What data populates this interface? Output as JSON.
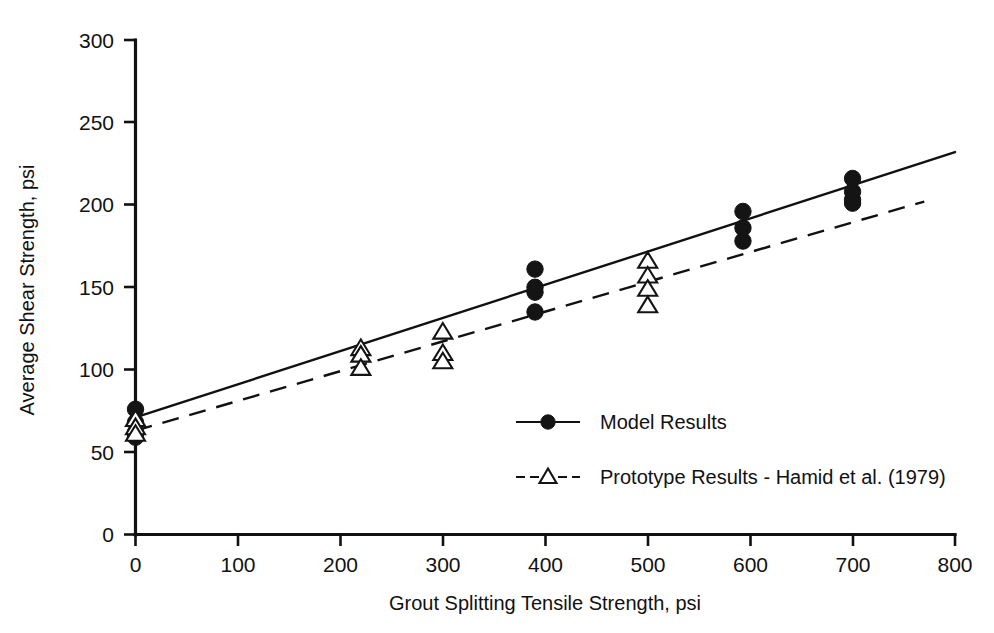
{
  "chart_data": {
    "type": "scatter",
    "title": "",
    "xlabel": "Grout Splitting Tensile Strength, psi",
    "ylabel": "Average Shear Strength, psi",
    "xlim": [
      0,
      800
    ],
    "ylim": [
      0,
      300
    ],
    "xticks": [
      0,
      100,
      200,
      300,
      400,
      500,
      600,
      700,
      800
    ],
    "yticks": [
      0,
      50,
      100,
      150,
      200,
      250,
      300
    ],
    "xtick_labels": [
      "0",
      "100",
      "200",
      "300",
      "400",
      "500",
      "600",
      "700",
      "800"
    ],
    "ytick_labels": [
      "0",
      "50",
      "100",
      "150",
      "200",
      "250",
      "300"
    ],
    "grid": false,
    "legend_position": "center-right-inside",
    "series": [
      {
        "name": "Model Results",
        "marker": "filled-circle",
        "line_style": "solid",
        "points": [
          {
            "x": 0,
            "y": 76
          },
          {
            "x": 0,
            "y": 68
          },
          {
            "x": 0,
            "y": 62
          },
          {
            "x": 0,
            "y": 59
          },
          {
            "x": 390,
            "y": 161
          },
          {
            "x": 390,
            "y": 150
          },
          {
            "x": 390,
            "y": 147
          },
          {
            "x": 390,
            "y": 135
          },
          {
            "x": 593,
            "y": 196
          },
          {
            "x": 593,
            "y": 186
          },
          {
            "x": 593,
            "y": 178
          },
          {
            "x": 700,
            "y": 216
          },
          {
            "x": 700,
            "y": 208
          },
          {
            "x": 700,
            "y": 203
          },
          {
            "x": 700,
            "y": 201
          }
        ],
        "fit_line": {
          "x1": 0,
          "y1": 71,
          "x2": 800,
          "y2": 232
        }
      },
      {
        "name": "Prototype Results -  Hamid et al. (1979)",
        "marker": "open-triangle",
        "line_style": "dashed",
        "points": [
          {
            "x": 0,
            "y": 70
          },
          {
            "x": 0,
            "y": 65
          },
          {
            "x": 0,
            "y": 61
          },
          {
            "x": 220,
            "y": 113
          },
          {
            "x": 220,
            "y": 109
          },
          {
            "x": 220,
            "y": 101
          },
          {
            "x": 300,
            "y": 123
          },
          {
            "x": 300,
            "y": 110
          },
          {
            "x": 300,
            "y": 105
          },
          {
            "x": 500,
            "y": 166
          },
          {
            "x": 500,
            "y": 157
          },
          {
            "x": 500,
            "y": 149
          },
          {
            "x": 500,
            "y": 139
          }
        ],
        "fit_line": {
          "x1": 0,
          "y1": 63,
          "x2": 770,
          "y2": 202
        }
      }
    ],
    "legend": [
      {
        "label": "Model Results",
        "marker": "filled-circle",
        "line_style": "solid"
      },
      {
        "label": "Prototype Results -  Hamid et al. (1979)",
        "marker": "open-triangle",
        "line_style": "dashed"
      }
    ]
  }
}
